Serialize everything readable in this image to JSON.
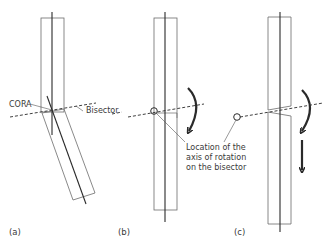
{
  "figure": {
    "panels": [
      {
        "id": "a",
        "label": "(a)"
      },
      {
        "id": "b",
        "label": "(b)"
      },
      {
        "id": "c",
        "label": "(c)"
      }
    ],
    "annotations": {
      "cora": "CORA",
      "bisector": "Bisector",
      "axis_location_line1": "Location of the",
      "axis_location_line2": "axis of rotation",
      "axis_location_line3": "on the bisector"
    },
    "colors": {
      "bone_outline": "#6b6b6b",
      "axis_line": "#2a2a2a",
      "arrow": "#2a2a2a",
      "text": "#3a3a3a"
    }
  }
}
